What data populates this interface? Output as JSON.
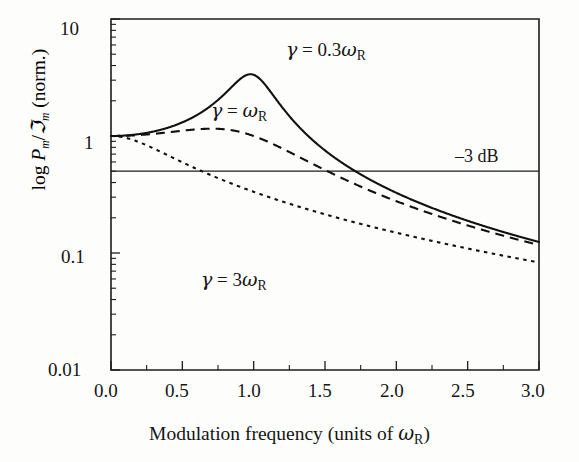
{
  "figure": {
    "type": "line-chart",
    "background": "#fdfdfc",
    "ink_color": "#111111"
  },
  "axes": {
    "x": {
      "title_parts": {
        "main": "Modulation frequency (units of ",
        "symbol": "ω",
        "symbol_sub": "R",
        "close": ")"
      },
      "title_plain": "Modulation frequency (units of ωR)",
      "tick_labels": [
        "0.0",
        "0.5",
        "1.0",
        "1.5",
        "2.0",
        "2.5",
        "3.0"
      ],
      "tick_values": [
        0.0,
        0.5,
        1.0,
        1.5,
        2.0,
        2.5,
        3.0
      ],
      "range": [
        0.0,
        3.0
      ],
      "scale": "linear",
      "minor_ticks_per_interval": 1
    },
    "y": {
      "title_plain": "log Pm/ℑm (norm.)",
      "title_parts": {
        "prefix": "log ",
        "num": "P",
        "num_sub": "m",
        "slash": "/",
        "den": "ℑ",
        "den_sub": "m",
        "suffix": " (norm.)"
      },
      "tick_labels": [
        "10",
        "1",
        "0.1",
        "0.01"
      ],
      "tick_values": [
        10,
        1,
        0.1,
        0.01
      ],
      "range": [
        0.01,
        10
      ],
      "scale": "log",
      "decades": 3
    }
  },
  "reference_line": {
    "label": "–3 dB",
    "value": 0.5,
    "style": "solid-thin"
  },
  "curve_labels": [
    {
      "id": "gamma-0p3",
      "plain": "γ = 0.3ωR",
      "gamma": "γ",
      "equals": " = ",
      "coef": "0.3",
      "omega": "ω",
      "omega_sub": "R",
      "x_px": 286,
      "y_px": 40
    },
    {
      "id": "gamma-1",
      "plain": "γ = ωR",
      "gamma": "γ",
      "equals": " = ",
      "coef": "",
      "omega": "ω",
      "omega_sub": "R",
      "x_px": 211,
      "y_px": 101
    },
    {
      "id": "gamma-3",
      "plain": "γ = 3ωR",
      "gamma": "γ",
      "equals": " = ",
      "coef": "3",
      "omega": "ω",
      "omega_sub": "R",
      "x_px": 201,
      "y_px": 270
    }
  ],
  "chart_data": {
    "type": "line",
    "title": "",
    "subtitle": "",
    "xlabel": "Modulation frequency (units of ωR)",
    "ylabel": "log Pm/ℑm (norm.)",
    "xlim": [
      0.0,
      3.0
    ],
    "ylim": [
      0.01,
      10.0
    ],
    "yscale": "log",
    "xscale": "linear",
    "grid": false,
    "legend": "inline-annotations",
    "annotations": [
      {
        "text": "γ = 0.3ωR",
        "x": 1.55,
        "y": 5.5
      },
      {
        "text": "γ = ωR",
        "x": 0.75,
        "y": 2.1
      },
      {
        "text": "γ = 3ωR",
        "x": 0.65,
        "y": 0.085
      },
      {
        "text": "–3 dB",
        "x": 2.55,
        "y": 0.62
      }
    ],
    "hlines": [
      {
        "y": 0.5,
        "label": "–3 dB"
      }
    ],
    "x": [
      0.0,
      0.1,
      0.2,
      0.3,
      0.4,
      0.5,
      0.6,
      0.7,
      0.8,
      0.9,
      0.95,
      1.0,
      1.1,
      1.2,
      1.3,
      1.4,
      1.5,
      1.6,
      1.7,
      1.8,
      1.9,
      2.0,
      2.2,
      2.4,
      2.6,
      2.8,
      3.0
    ],
    "series": [
      {
        "name": "γ = 0.3ωR",
        "style": "solid",
        "gamma": 0.3,
        "values": [
          1.0,
          1.01,
          1.04,
          1.1,
          1.19,
          1.35,
          1.58,
          1.96,
          2.69,
          4.6,
          6.5,
          10.4,
          3.6,
          2.07,
          1.37,
          0.99,
          0.75,
          0.6,
          0.49,
          0.41,
          0.34,
          0.29,
          0.22,
          0.17,
          0.14,
          0.115,
          0.096
        ]
      },
      {
        "name": "γ = ωR",
        "style": "dashed",
        "gamma": 1.0,
        "values": [
          1.0,
          1.0,
          1.01,
          1.04,
          1.08,
          1.13,
          1.19,
          1.24,
          1.26,
          1.23,
          1.19,
          1.12,
          0.94,
          0.77,
          0.63,
          0.53,
          0.44,
          0.38,
          0.33,
          0.28,
          0.25,
          0.22,
          0.17,
          0.14,
          0.12,
          0.1,
          0.085
        ]
      },
      {
        "name": "γ = 3ωR",
        "style": "dotted",
        "gamma": 3.0,
        "values": [
          1.0,
          0.96,
          0.86,
          0.73,
          0.61,
          0.5,
          0.41,
          0.34,
          0.28,
          0.235,
          0.215,
          0.2,
          0.17,
          0.145,
          0.125,
          0.109,
          0.096,
          0.085,
          0.075,
          0.067,
          0.06,
          0.055,
          0.045,
          0.038,
          0.032,
          0.027,
          0.024
        ]
      }
    ]
  },
  "geometry": {
    "plot_left_px": 111,
    "plot_right_px": 539,
    "plot_top_px": 19,
    "plot_bottom_px": 370
  }
}
